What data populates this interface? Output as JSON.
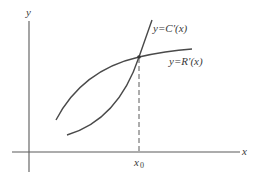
{
  "diagram": {
    "axes": {
      "y_label": "y",
      "x_label": "x"
    },
    "curves": [
      {
        "id": "marginal-cost",
        "label": "y=C′(x)",
        "shape": "increasing, steep, concave-up/linear-ish, crosses R′ at x0"
      },
      {
        "id": "marginal-revenue",
        "label": "y=R′(x)",
        "shape": "increasing, concave-down, flattening"
      }
    ],
    "intersection": {
      "x_label": "x",
      "x_label_subscript": "0",
      "note": "dashed vertical line from intersection to x-axis"
    },
    "colors": {
      "stroke": "#555555",
      "text": "#3a3a3a",
      "background": "#ffffff"
    }
  }
}
